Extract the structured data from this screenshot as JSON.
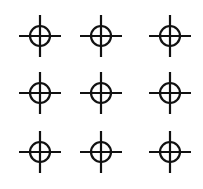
{
  "figure": {
    "rows": 3,
    "columns": 3,
    "symbol": "crosshair-icon",
    "stroke_color": "#111111",
    "background_color": "#ffffff",
    "items": [
      {
        "row": 1,
        "col": 1,
        "icon": "crosshair-icon"
      },
      {
        "row": 1,
        "col": 2,
        "icon": "crosshair-icon"
      },
      {
        "row": 1,
        "col": 3,
        "icon": "crosshair-icon"
      },
      {
        "row": 2,
        "col": 1,
        "icon": "crosshair-icon"
      },
      {
        "row": 2,
        "col": 2,
        "icon": "crosshair-icon"
      },
      {
        "row": 2,
        "col": 3,
        "icon": "crosshair-icon"
      },
      {
        "row": 3,
        "col": 1,
        "icon": "crosshair-icon"
      },
      {
        "row": 3,
        "col": 2,
        "icon": "crosshair-icon"
      },
      {
        "row": 3,
        "col": 3,
        "icon": "crosshair-icon"
      }
    ]
  }
}
